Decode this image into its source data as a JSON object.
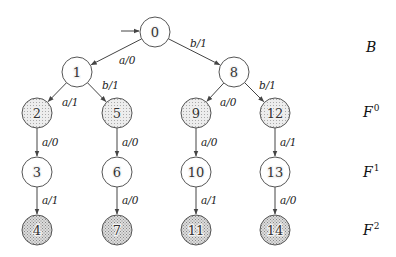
{
  "diagram": {
    "type": "state-tree",
    "colors": {
      "edge": "#444444",
      "node_stroke": "#555555",
      "node_fill_light": "#e6e6e6",
      "node_fill_medium": "#d0d0d0",
      "hatch": "#777777"
    },
    "nodes": [
      {
        "id": "0",
        "label": "0",
        "x": 155,
        "y": 32,
        "fill": "hatched"
      },
      {
        "id": "1",
        "label": "1",
        "x": 77,
        "y": 72,
        "fill": "hatched"
      },
      {
        "id": "8",
        "label": "8",
        "x": 234,
        "y": 72,
        "fill": "hatched"
      },
      {
        "id": "2",
        "label": "2",
        "x": 37,
        "y": 113,
        "fill": "dotted"
      },
      {
        "id": "5",
        "label": "5",
        "x": 117,
        "y": 113,
        "fill": "dotted"
      },
      {
        "id": "9",
        "label": "9",
        "x": 196,
        "y": 113,
        "fill": "dotted"
      },
      {
        "id": "12",
        "label": "12",
        "x": 275,
        "y": 113,
        "fill": "dotted"
      },
      {
        "id": "3",
        "label": "3",
        "x": 37,
        "y": 172,
        "fill": "hatched"
      },
      {
        "id": "6",
        "label": "6",
        "x": 117,
        "y": 172,
        "fill": "hatched"
      },
      {
        "id": "10",
        "label": "10",
        "x": 196,
        "y": 172,
        "fill": "hatched"
      },
      {
        "id": "13",
        "label": "13",
        "x": 275,
        "y": 172,
        "fill": "hatched"
      },
      {
        "id": "4",
        "label": "4",
        "x": 37,
        "y": 230,
        "fill": "crosshatch"
      },
      {
        "id": "7",
        "label": "7",
        "x": 117,
        "y": 230,
        "fill": "crosshatch"
      },
      {
        "id": "11",
        "label": "11",
        "x": 196,
        "y": 230,
        "fill": "crosshatch"
      },
      {
        "id": "14",
        "label": "14",
        "x": 275,
        "y": 230,
        "fill": "crosshatch"
      }
    ],
    "initial_arrow": {
      "to": "0"
    },
    "edges": [
      {
        "from": "0",
        "to": "1",
        "label": "a/0",
        "lx": 119,
        "ly": 64
      },
      {
        "from": "0",
        "to": "8",
        "label": "b/1",
        "lx": 190,
        "ly": 47
      },
      {
        "from": "1",
        "to": "2",
        "label": "a/1",
        "lx": 62,
        "ly": 106
      },
      {
        "from": "1",
        "to": "5",
        "label": "b/1",
        "lx": 102,
        "ly": 89
      },
      {
        "from": "8",
        "to": "9",
        "label": "a/0",
        "lx": 220,
        "ly": 106
      },
      {
        "from": "8",
        "to": "12",
        "label": "b/1",
        "lx": 259,
        "ly": 89
      },
      {
        "from": "2",
        "to": "3",
        "label": "a/0",
        "lx": 42,
        "ly": 146
      },
      {
        "from": "5",
        "to": "6",
        "label": "a/0",
        "lx": 122,
        "ly": 146
      },
      {
        "from": "9",
        "to": "10",
        "label": "a/0",
        "lx": 201,
        "ly": 146
      },
      {
        "from": "12",
        "to": "13",
        "label": "a/1",
        "lx": 280,
        "ly": 146
      },
      {
        "from": "3",
        "to": "4",
        "label": "a/1",
        "lx": 42,
        "ly": 204
      },
      {
        "from": "6",
        "to": "7",
        "label": "a/0",
        "lx": 122,
        "ly": 204
      },
      {
        "from": "10",
        "to": "11",
        "label": "a/1",
        "lx": 201,
        "ly": 204
      },
      {
        "from": "13",
        "to": "14",
        "label": "a/0",
        "lx": 280,
        "ly": 204
      }
    ],
    "row_labels": [
      {
        "base": "B",
        "sup": "",
        "x": 366,
        "y": 52
      },
      {
        "base": "F",
        "sup": "0",
        "x": 363,
        "y": 117
      },
      {
        "base": "F",
        "sup": "1",
        "x": 363,
        "y": 177
      },
      {
        "base": "F",
        "sup": "2",
        "x": 363,
        "y": 235
      }
    ]
  }
}
